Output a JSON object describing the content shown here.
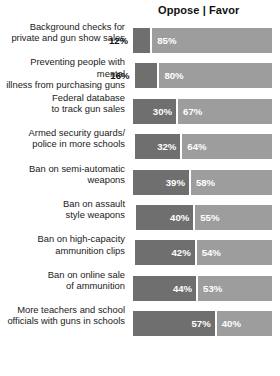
{
  "header": {
    "legend": "Oppose | Favor",
    "oppose_label": "Oppose",
    "favor_label": "Favor",
    "separator": "|"
  },
  "colors": {
    "oppose": "#6f6f6f",
    "favor": "#9d9d9d",
    "background": "#ffffff",
    "text": "#111111",
    "value_text_inside": "#ffffff"
  },
  "chart_data": {
    "type": "bar",
    "orientation": "horizontal",
    "stacked": true,
    "title": "",
    "subtitle": "",
    "xlabel": "",
    "ylabel": "",
    "xlim": [
      0,
      100
    ],
    "grid": false,
    "legend_position": "top-right",
    "legend": [
      "Oppose",
      "Favor"
    ],
    "categories": [
      "Background checks for\nprivate and gun show sales",
      "Preventing people with mental\nillness from purchasing guns",
      "Federal database\nto track gun sales",
      "Armed security guards/\npolice in more schools",
      "Ban on semi-automatic\nweapons",
      "Ban on assault\nstyle weapons",
      "Ban on high-capacity\nammunition clips",
      "Ban on online sale\nof ammunition",
      "More teachers and school\nofficials with guns in schools"
    ],
    "series": [
      {
        "name": "Oppose",
        "color": "#6f6f6f",
        "values": [
          12,
          16,
          30,
          32,
          39,
          40,
          42,
          44,
          57
        ],
        "labels": [
          "12%",
          "16%",
          "30%",
          "32%",
          "39%",
          "40%",
          "42%",
          "44%",
          "57%"
        ]
      },
      {
        "name": "Favor",
        "color": "#9d9d9d",
        "values": [
          85,
          80,
          67,
          64,
          58,
          55,
          54,
          53,
          40
        ],
        "labels": [
          "85%",
          "80%",
          "67%",
          "64%",
          "58%",
          "55%",
          "54%",
          "53%",
          "40%"
        ]
      }
    ]
  },
  "rows": [
    {
      "label": "Background checks for\nprivate and gun show sales",
      "oppose": 12,
      "favor": 85,
      "oppose_label": "12%",
      "favor_label": "85%",
      "oppose_label_outside": true
    },
    {
      "label": "Preventing people with mental\nillness from purchasing guns",
      "oppose": 16,
      "favor": 80,
      "oppose_label": "16%",
      "favor_label": "80%",
      "oppose_label_outside": true
    },
    {
      "label": "Federal database\nto track gun sales",
      "oppose": 30,
      "favor": 67,
      "oppose_label": "30%",
      "favor_label": "67%",
      "oppose_label_outside": false
    },
    {
      "label": "Armed security guards/\npolice in more schools",
      "oppose": 32,
      "favor": 64,
      "oppose_label": "32%",
      "favor_label": "64%",
      "oppose_label_outside": false
    },
    {
      "label": "Ban on semi-automatic\nweapons",
      "oppose": 39,
      "favor": 58,
      "oppose_label": "39%",
      "favor_label": "58%",
      "oppose_label_outside": false
    },
    {
      "label": "Ban on assault\nstyle weapons",
      "oppose": 40,
      "favor": 55,
      "oppose_label": "40%",
      "favor_label": "55%",
      "oppose_label_outside": false
    },
    {
      "label": "Ban on high-capacity\nammunition clips",
      "oppose": 42,
      "favor": 54,
      "oppose_label": "42%",
      "favor_label": "54%",
      "oppose_label_outside": false
    },
    {
      "label": "Ban on online sale\nof ammunition",
      "oppose": 44,
      "favor": 53,
      "oppose_label": "44%",
      "favor_label": "53%",
      "oppose_label_outside": false
    },
    {
      "label": "More teachers and school\nofficials with guns in schools",
      "oppose": 57,
      "favor": 40,
      "oppose_label": "57%",
      "favor_label": "40%",
      "oppose_label_outside": false
    }
  ]
}
